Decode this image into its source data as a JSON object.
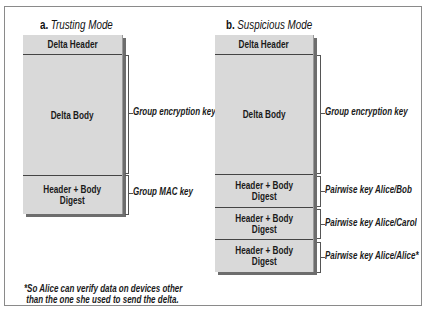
{
  "diagram": {
    "panel_a": {
      "letter": "a.",
      "title": "Trusting Mode",
      "cells": [
        {
          "text": "Delta Header"
        },
        {
          "text": "Delta Body"
        },
        {
          "line1": "Header + Body",
          "line2": "Digest"
        }
      ],
      "keys": [
        {
          "text": "Group encryption key"
        },
        {
          "text": "Group MAC key"
        }
      ]
    },
    "panel_b": {
      "letter": "b.",
      "title": "Suspicious Mode",
      "cells": [
        {
          "text": "Delta Header"
        },
        {
          "text": "Delta Body"
        },
        {
          "line1": "Header + Body",
          "line2": "Digest"
        },
        {
          "line1": "Header + Body",
          "line2": "Digest"
        },
        {
          "line1": "Header + Body",
          "line2": "Digest"
        }
      ],
      "keys": [
        {
          "text": "Group encryption key"
        },
        {
          "text": "Pairwise key Alice/Bob"
        },
        {
          "text": "Pairwise key Alice/Carol"
        },
        {
          "text": "Pairwise key Alice/Alice*"
        }
      ]
    },
    "footnote": {
      "line1": "*So Alice can verify data on devices other",
      "line2": " than the one she used to send the delta."
    },
    "colors": {
      "cell_fill": "#d9d9d9",
      "shadow": "#6d6d6d",
      "frame": "#8a8a8a"
    }
  }
}
